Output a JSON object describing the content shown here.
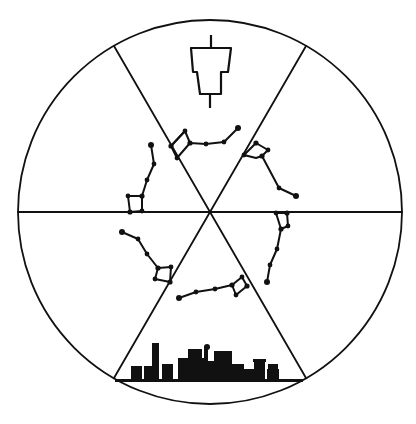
{
  "diagram": {
    "title": "Rotation of the Big Dipper around the pole star",
    "circle": {
      "cx": 210,
      "cy": 212,
      "r": 192,
      "stroke": "#111111"
    },
    "sectors": 6,
    "top_symbol": "lantern-tower",
    "bottom_symbol": "city-skyline",
    "constellation": "Big Dipper",
    "positions": 6,
    "colors": {
      "ink": "#111111",
      "paper": "#ffffff"
    }
  }
}
